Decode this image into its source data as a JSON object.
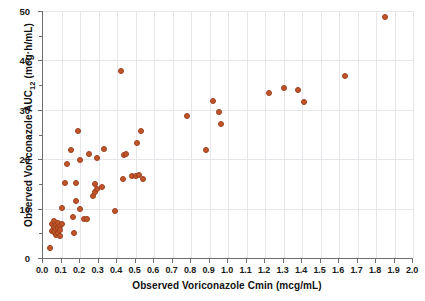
{
  "chart_data": {
    "type": "scatter",
    "title": "",
    "xlabel": "Observed Voriconazole Cmin (mcg/mL)",
    "ylabel_prefix": "Observed Voriconazole AUC",
    "ylabel_sub": "12",
    "ylabel_suffix": " (mcg·h/mL)",
    "ylabel_full": "Observed Voriconazole AUC12 (mcg·h/mL)",
    "xlim": [
      0.0,
      2.0
    ],
    "ylim": [
      0,
      50
    ],
    "xticks": [
      0.0,
      0.1,
      0.2,
      0.3,
      0.4,
      0.5,
      0.6,
      0.7,
      0.8,
      0.9,
      1.0,
      1.1,
      1.2,
      1.3,
      1.4,
      1.5,
      1.6,
      1.7,
      1.8,
      1.9,
      2.0
    ],
    "xticklabels": [
      "0.0",
      "0.1",
      "0.2",
      "0.3",
      "0.4",
      "0.5",
      "0.6",
      "0.7",
      "0.8",
      "0.9",
      "1.0",
      "1.1",
      "1.2",
      "1.3",
      "1.4",
      "1.5",
      "1.6",
      "1.7",
      "1.8",
      "1.9",
      "2.0"
    ],
    "yticks": [
      0,
      10,
      20,
      30,
      40,
      50
    ],
    "yticklabels": [
      "0",
      "10",
      "20",
      "30",
      "40",
      "50"
    ],
    "yminorticks": [
      5,
      15,
      25,
      35,
      45
    ],
    "grid": true,
    "grid_color": "#e6e6ea",
    "marker_color": "#c2562a",
    "marker_edge_color": "#9c3f1c",
    "marker_size": 6,
    "legend": null,
    "n_points": 62,
    "points": [
      [
        0.04,
        2.0
      ],
      [
        0.05,
        6.8
      ],
      [
        0.05,
        5.4
      ],
      [
        0.06,
        7.4
      ],
      [
        0.06,
        6.2
      ],
      [
        0.06,
        5.2
      ],
      [
        0.07,
        6.6
      ],
      [
        0.07,
        5.8
      ],
      [
        0.07,
        4.6
      ],
      [
        0.08,
        7.0
      ],
      [
        0.08,
        6.0
      ],
      [
        0.08,
        5.0
      ],
      [
        0.09,
        6.4
      ],
      [
        0.09,
        5.6
      ],
      [
        0.09,
        4.4
      ],
      [
        0.1,
        6.8
      ],
      [
        0.1,
        10.2
      ],
      [
        0.12,
        15.2
      ],
      [
        0.13,
        19.0
      ],
      [
        0.15,
        21.9
      ],
      [
        0.16,
        8.2
      ],
      [
        0.17,
        5.0
      ],
      [
        0.18,
        11.6
      ],
      [
        0.18,
        15.2
      ],
      [
        0.19,
        25.8
      ],
      [
        0.2,
        10.0
      ],
      [
        0.2,
        19.8
      ],
      [
        0.22,
        7.8
      ],
      [
        0.24,
        7.8
      ],
      [
        0.25,
        21.0
      ],
      [
        0.27,
        12.6
      ],
      [
        0.28,
        13.4
      ],
      [
        0.28,
        15.0
      ],
      [
        0.29,
        20.2
      ],
      [
        0.29,
        14.0
      ],
      [
        0.32,
        14.3
      ],
      [
        0.33,
        22.0
      ],
      [
        0.39,
        9.5
      ],
      [
        0.42,
        37.9
      ],
      [
        0.43,
        16.0
      ],
      [
        0.44,
        20.8
      ],
      [
        0.45,
        21.0
      ],
      [
        0.48,
        16.6
      ],
      [
        0.5,
        16.6
      ],
      [
        0.51,
        23.2
      ],
      [
        0.52,
        16.8
      ],
      [
        0.53,
        25.8
      ],
      [
        0.54,
        16.0
      ],
      [
        0.78,
        28.8
      ],
      [
        0.88,
        21.8
      ],
      [
        0.92,
        31.8
      ],
      [
        0.95,
        29.6
      ],
      [
        0.96,
        27.2
      ],
      [
        1.22,
        33.4
      ],
      [
        1.3,
        34.5
      ],
      [
        1.38,
        34.0
      ],
      [
        1.41,
        31.6
      ],
      [
        1.63,
        36.8
      ],
      [
        1.85,
        48.8
      ]
    ]
  }
}
